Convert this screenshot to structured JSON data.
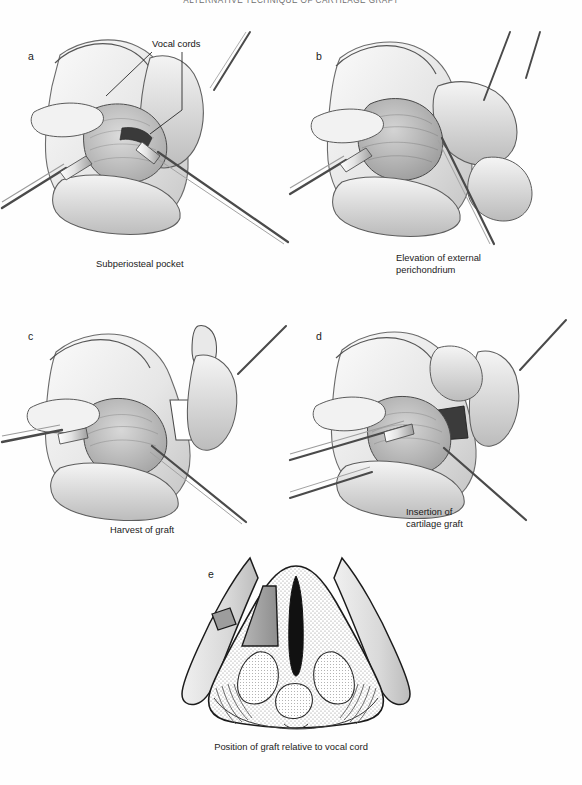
{
  "header": {
    "running_title": "ALTERNATIVE TECHNIQUE OF CARTILAGE GRAFT"
  },
  "figure": {
    "panels": [
      {
        "letter": "a",
        "caption": "Subperiosteal pocket",
        "annotations": [
          {
            "label": "Vocal cords"
          }
        ]
      },
      {
        "letter": "b",
        "caption": "Elevation of external\nperichondrium"
      },
      {
        "letter": "c",
        "caption": "Harvest of graft"
      },
      {
        "letter": "d",
        "caption": "Insertion of\ncartilage graft"
      },
      {
        "letter": "e",
        "caption": "Position of graft relative to vocal cord"
      }
    ]
  },
  "colors": {
    "ink": "#1a1a1a",
    "line": "#4a4a4a",
    "cartilage_fill": "#efefef",
    "cartilage_shade": "#cfcfcf",
    "graft_gray": "#9a9a9a",
    "airway_black": "#111111",
    "stipple": "#8d8d8d",
    "paper": "#fefefe"
  }
}
